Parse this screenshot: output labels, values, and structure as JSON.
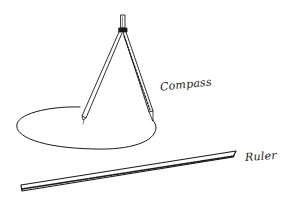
{
  "diagram": {
    "style": "hand-drawn pen sketch",
    "stroke_color": "#1a1a1a",
    "background": "#ffffff",
    "labels": {
      "compass": "Compass",
      "ruler": "Ruler"
    },
    "objects": [
      {
        "name": "compass",
        "description": "drawing compass with two legs, standing on paper"
      },
      {
        "name": "circle",
        "description": "ellipse traced by the compass"
      },
      {
        "name": "ruler",
        "description": "long straightedge ruler lying diagonally"
      }
    ]
  }
}
